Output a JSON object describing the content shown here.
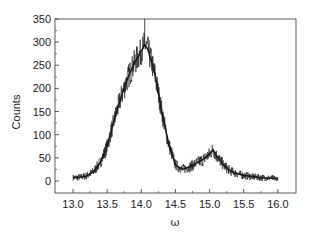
{
  "chart_data": {
    "type": "line",
    "title": "",
    "xlabel": "ω",
    "ylabel": "Counts",
    "xlim": [
      12.75,
      16.25
    ],
    "ylim": [
      -25,
      350
    ],
    "xticks": [
      13.0,
      13.5,
      14.0,
      14.5,
      15.0,
      15.5,
      16.0
    ],
    "xtick_labels": [
      "13.0",
      "13.5",
      "14.0",
      "14.5",
      "15.0",
      "15.5",
      "16.0"
    ],
    "yticks": [
      0,
      50,
      100,
      150,
      200,
      250,
      300,
      350
    ],
    "ytick_labels": [
      "0",
      "50",
      "100",
      "150",
      "200",
      "250",
      "300",
      "350"
    ],
    "grid": false,
    "legend": null,
    "series": [
      {
        "name": "Counts",
        "color": "#1a1a1a",
        "x": [
          13.0,
          13.1,
          13.2,
          13.3,
          13.4,
          13.5,
          13.6,
          13.7,
          13.8,
          13.9,
          14.0,
          14.05,
          14.1,
          14.2,
          14.3,
          14.4,
          14.5,
          14.6,
          14.7,
          14.8,
          14.9,
          15.0,
          15.05,
          15.1,
          15.2,
          15.3,
          15.4,
          15.5,
          15.6,
          15.7,
          15.8,
          15.9,
          16.0
        ],
        "y": [
          7,
          8,
          11,
          20,
          40,
          75,
          130,
          180,
          222,
          255,
          280,
          295,
          283,
          230,
          150,
          80,
          35,
          25,
          30,
          38,
          46,
          58,
          68,
          55,
          35,
          22,
          16,
          12,
          10,
          8,
          7,
          6,
          5
        ]
      }
    ],
    "annotations": [
      {
        "note": "noise spike at peak",
        "x": 14.05,
        "y": 350
      }
    ]
  }
}
